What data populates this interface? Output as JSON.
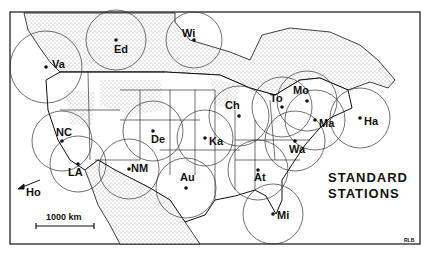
{
  "map": {
    "title_line1": "STANDARD",
    "title_line2": "STATIONS",
    "scale_label": "1000 km",
    "offmap_label": "Ho",
    "signature": "RLB",
    "colors": {
      "ink": "#111111",
      "land_stipple": "#b0b0b0",
      "background": "#ffffff"
    }
  },
  "stations": [
    {
      "code": "Va",
      "x": 46,
      "y": 67,
      "r": 36
    },
    {
      "code": "Ed",
      "x": 116,
      "y": 40,
      "r": 30
    },
    {
      "code": "Wi",
      "x": 194,
      "y": 40,
      "r": 28
    },
    {
      "code": "NC",
      "x": 62,
      "y": 141,
      "r": 30
    },
    {
      "code": "LA",
      "x": 78,
      "y": 164,
      "r": 28
    },
    {
      "code": "De",
      "x": 153,
      "y": 131,
      "r": 30
    },
    {
      "code": "NM",
      "x": 129,
      "y": 169,
      "r": 30
    },
    {
      "code": "Ka",
      "x": 205,
      "y": 138,
      "r": 28
    },
    {
      "code": "Au",
      "x": 186,
      "y": 188,
      "r": 30
    },
    {
      "code": "Ch",
      "x": 239,
      "y": 116,
      "r": 30
    },
    {
      "code": "To",
      "x": 282,
      "y": 107,
      "r": 30
    },
    {
      "code": "Mo",
      "x": 307,
      "y": 101,
      "r": 30
    },
    {
      "code": "Ma",
      "x": 315,
      "y": 120,
      "r": 30
    },
    {
      "code": "Ha",
      "x": 360,
      "y": 118,
      "r": 30
    },
    {
      "code": "Wa",
      "x": 295,
      "y": 141,
      "r": 30
    },
    {
      "code": "At",
      "x": 258,
      "y": 170,
      "r": 30
    },
    {
      "code": "Mi",
      "x": 273,
      "y": 214,
      "r": 30
    }
  ]
}
